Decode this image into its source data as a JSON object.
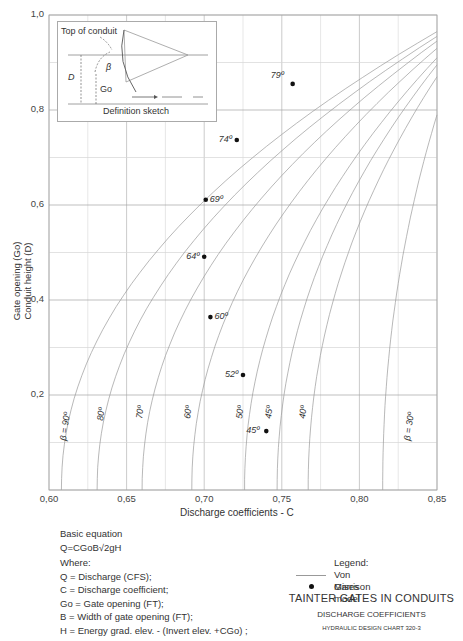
{
  "chart_data": {
    "type": "line",
    "title": "TAINTER GATES IN CONDUITS",
    "subtitle": "DISCHARGE COEFFICIENTS",
    "chart_id": "HYDRAULIC DESIGN CHART 320-3",
    "xlabel": "Discharge coefficients - C",
    "ylabel_lines": [
      "Gate opening (Go)",
      "Conduit height (D)"
    ],
    "xlim": [
      0.6,
      0.85
    ],
    "ylim": [
      0.0,
      1.0
    ],
    "x_ticks": [
      "0,60",
      "0,65",
      "0,70",
      "0,75",
      "0,80",
      "0,85"
    ],
    "y_ticks": [
      "0,2",
      "0,4",
      "0,6",
      "0,8",
      "1,0"
    ],
    "grid": true,
    "legend": {
      "title": "Legend:",
      "entries": [
        {
          "label": "Von Mises",
          "marker": "line"
        },
        {
          "label": "Garrison model",
          "marker": "dot"
        }
      ]
    },
    "von_mises_curves": [
      {
        "beta": "β = 90º",
        "c_at_y0": 0.608,
        "c_at_y1": 0.85
      },
      {
        "beta": "80º",
        "c_at_y0": 0.631,
        "c_at_y1": 0.85
      },
      {
        "beta": "70º",
        "c_at_y0": 0.66,
        "c_at_y1": 0.85
      },
      {
        "beta": "60º",
        "c_at_y0": 0.692,
        "c_at_y1": 0.85
      },
      {
        "beta": "50º",
        "c_at_y0": 0.726,
        "c_at_y1": 0.85
      },
      {
        "beta": "45º",
        "c_at_y0": 0.747,
        "c_at_y1": 0.85
      },
      {
        "beta": "40º",
        "c_at_y0": 0.767,
        "c_at_y1": 0.85
      },
      {
        "beta": "β = 30º",
        "c_at_y0": 0.815,
        "c_at_y1": 0.85
      }
    ],
    "garrison_points": [
      {
        "label": "79º",
        "C": 0.757,
        "y": 0.855
      },
      {
        "label": "74º",
        "C": 0.721,
        "y": 0.737
      },
      {
        "label": "69º",
        "C": 0.701,
        "y": 0.611
      },
      {
        "label": "64º",
        "C": 0.7,
        "y": 0.491
      },
      {
        "label": "60º",
        "C": 0.704,
        "y": 0.364
      },
      {
        "label": "52º",
        "C": 0.725,
        "y": 0.242
      },
      {
        "label": "45º",
        "C": 0.74,
        "y": 0.124
      }
    ]
  },
  "sketch": {
    "top_label": "Top of conduit",
    "d_label": "D",
    "beta_label": "β",
    "go_label": "Go",
    "caption": "Definition sketch"
  },
  "equation": {
    "heading": "Basic equation",
    "formula": "Q=CGoB√2gH",
    "where": "Where:",
    "defs": [
      "Q = Discharge (CFS);",
      "C = Discharge coefficient;",
      "Go = Gate opening (FT);",
      "B = Width of gate opening (FT);",
      "H = Energy grad. elev. - (Invert elev. +CGo) ;"
    ]
  },
  "legend_text": {
    "title": "Legend:",
    "von_mises": "Von Mises",
    "garrison": "Garrison model"
  },
  "title_block": {
    "line1": "TAINTER GATES IN CONDUITS",
    "line2": "DISCHARGE COEFFICIENTS",
    "line3": "HYDRAULIC DESIGN CHART 320-3"
  },
  "colors": {
    "grid_major": "#9a9a9a",
    "grid_minor": "#d6d6d6",
    "curve": "#9a9a9a",
    "point": "#111111"
  }
}
